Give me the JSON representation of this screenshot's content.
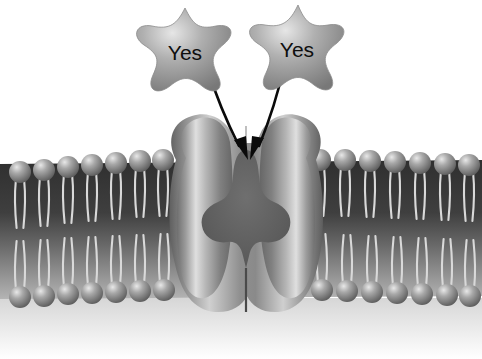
{
  "figure": {
    "type": "biology-diagram",
    "background_color": "#ffffff"
  },
  "ligands": [
    {
      "name": "star-molecule-left",
      "label": "Yes",
      "shape": "four-pointed-star",
      "center": [
        185,
        48
      ],
      "fill_color": "#9a9a9a"
    },
    {
      "name": "star-molecule-right",
      "label": "Yes",
      "shape": "four-pointed-star",
      "center": [
        296,
        45
      ],
      "fill_color": "#9a9a9a"
    }
  ],
  "arrows": [
    {
      "name": "arrow-left",
      "from": [
        208,
        70
      ],
      "to": [
        240,
        152
      ],
      "color": "#0a0a0a"
    },
    {
      "name": "arrow-right",
      "from": [
        284,
        66
      ],
      "to": [
        256,
        152
      ],
      "color": "#0a0a0a"
    }
  ],
  "membrane": {
    "name": "phospholipid-bilayer",
    "outer_leaflet_y": 165,
    "inner_leaflet_y": 292,
    "head_color": "#8f8f8f",
    "tail_color": "#cfcfcf",
    "core_color": "#3a3a3a",
    "heads_left_top": 7,
    "heads_right_top": 7,
    "heads_left_bottom": 7,
    "heads_right_bottom": 7,
    "head_radius": 11,
    "tails_per_lipid": 2
  },
  "protein": {
    "name": "channel-protein",
    "fill_color": "#8a8a8a",
    "highlight_color": "#d8d8d8",
    "pore_color": "#5e5e5e",
    "center_x": 246,
    "top_y": 114,
    "bottom_y": 312,
    "width": 156,
    "pore_open": true
  }
}
